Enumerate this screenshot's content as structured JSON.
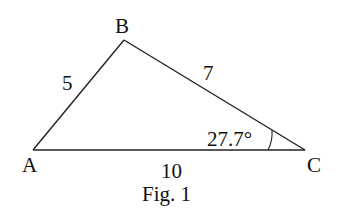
{
  "figure": {
    "caption": "Fig. 1",
    "vertices": {
      "A": {
        "label": "A",
        "x": 33,
        "y": 150
      },
      "B": {
        "label": "B",
        "x": 124,
        "y": 40
      },
      "C": {
        "label": "C",
        "x": 305,
        "y": 150
      }
    },
    "sides": {
      "AB": {
        "label": "5"
      },
      "BC": {
        "label": "7"
      },
      "AC": {
        "label": "10"
      }
    },
    "angle_C": {
      "label": "27.7°"
    },
    "stroke_color": "#222222",
    "text_color": "#111111"
  }
}
